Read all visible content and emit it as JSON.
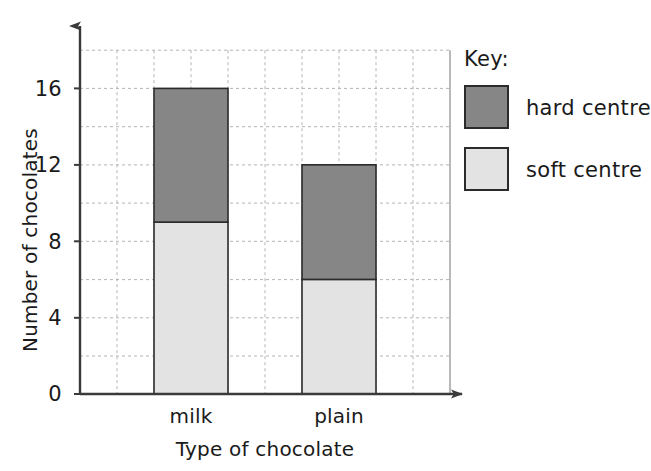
{
  "chart_data": {
    "type": "bar",
    "subtype": "stacked-bar",
    "title": "",
    "xlabel": "Type of chocolate",
    "ylabel": "Number of chocolates",
    "categories": [
      "milk",
      "plain"
    ],
    "series": [
      {
        "name": "soft centre",
        "values": [
          9,
          6
        ],
        "color": "#e3e3e3"
      },
      {
        "name": "hard centre",
        "values": [
          7,
          6
        ],
        "color": "#868686"
      }
    ],
    "totals": [
      16,
      12
    ],
    "ylim": [
      0,
      18
    ],
    "y_tick_labels": [
      "0",
      "4",
      "8",
      "12",
      "16"
    ],
    "y_tick_values": [
      0,
      4,
      8,
      12,
      16
    ],
    "y_gridline_values": [
      2,
      4,
      6,
      8,
      10,
      12,
      14,
      16,
      18
    ],
    "grid": true,
    "legend_position": "right"
  },
  "legend": {
    "title": "Key:",
    "entries": [
      {
        "label": "hard centre",
        "color": "#868686"
      },
      {
        "label": "soft centre",
        "color": "#e3e3e3"
      }
    ]
  },
  "axes": {
    "y_title": "Number of chocolates",
    "x_title": "Type of chocolate",
    "y_ticks": [
      "16",
      "12",
      "8",
      "4",
      "0"
    ],
    "x_categories": [
      "milk",
      "plain"
    ]
  },
  "colors": {
    "hard_centre": "#868686",
    "soft_centre": "#e3e3e3",
    "axis": "#3a3a3a",
    "grid": "#b4b4b4",
    "bar_outline": "#2b2b2b",
    "text": "#1a1a1a",
    "background": "#ffffff"
  }
}
